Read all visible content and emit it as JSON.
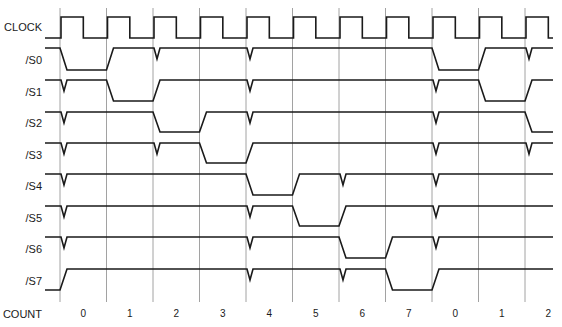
{
  "colors": {
    "trace": "#1a1a1a",
    "grid": "#8a8a8a",
    "background": "#ffffff"
  },
  "layout": {
    "grid_x0": 60,
    "grid_pitch": 46.5,
    "grid_count": 11,
    "grid_top": 8,
    "grid_bottom": 302,
    "signal_start_x": 45,
    "signal_end_x": 553,
    "edge_width": 7,
    "glitch_depth": 11,
    "glitch_width": 6,
    "row_pitch": 31.6
  },
  "clock": {
    "label": "CLOCK",
    "label_y": 27,
    "high_y": 17,
    "low_y": 38,
    "high_fraction": 0.48
  },
  "signals": [
    {
      "label": "/S0",
      "label_y": 60,
      "high_y": 48,
      "low_y": 70,
      "initial": "high",
      "low_intervals": [
        [
          0,
          1
        ],
        [
          8,
          9
        ]
      ],
      "glitches": [
        2,
        4,
        10
      ]
    },
    {
      "label": "/S1",
      "label_y": 92,
      "high_y": 80,
      "low_y": 101,
      "initial": "high",
      "low_intervals": [
        [
          1,
          2
        ],
        [
          9,
          10
        ]
      ],
      "glitches": [
        0,
        4,
        8
      ]
    },
    {
      "label": "/S2",
      "label_y": 123,
      "high_y": 112,
      "low_y": 132,
      "initial": "high",
      "low_intervals": [
        [
          2,
          3
        ],
        [
          10,
          11
        ]
      ],
      "glitches": [
        0,
        4,
        8
      ]
    },
    {
      "label": "/S3",
      "label_y": 155,
      "high_y": 143,
      "low_y": 163,
      "initial": "high",
      "low_intervals": [
        [
          3,
          4
        ]
      ],
      "glitches": [
        0,
        2,
        8,
        10
      ]
    },
    {
      "label": "/S4",
      "label_y": 186,
      "high_y": 174,
      "low_y": 195,
      "initial": "high",
      "low_intervals": [
        [
          4,
          5
        ]
      ],
      "glitches": [
        0,
        6,
        8
      ]
    },
    {
      "label": "/S5",
      "label_y": 218,
      "high_y": 206,
      "low_y": 226,
      "initial": "high",
      "low_intervals": [
        [
          5,
          6
        ]
      ],
      "glitches": [
        0,
        4,
        8
      ]
    },
    {
      "label": "/S6",
      "label_y": 249,
      "high_y": 237,
      "low_y": 258,
      "initial": "high",
      "low_intervals": [
        [
          6,
          7
        ]
      ],
      "glitches": [
        0,
        4,
        8
      ]
    },
    {
      "label": "/S7",
      "label_y": 281,
      "high_y": 269,
      "low_y": 290,
      "initial": "low",
      "low_intervals": [
        [
          -1,
          0
        ],
        [
          7,
          8
        ]
      ],
      "glitches": [
        4,
        6
      ]
    }
  ],
  "count": {
    "label": "COUNT",
    "label_y": 314,
    "values": [
      "0",
      "1",
      "2",
      "3",
      "4",
      "5",
      "6",
      "7",
      "0",
      "1",
      "2"
    ]
  }
}
